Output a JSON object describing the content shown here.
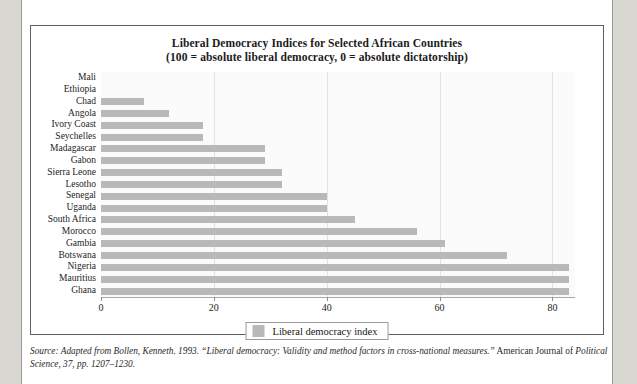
{
  "figure": {
    "title_line1": "Liberal Democracy Indices for Selected African Countries",
    "title_line2": "(100 = absolute liberal democracy, 0 = absolute dictatorship)"
  },
  "legend": {
    "label": "Liberal democracy index",
    "swatch_color": "#b9b9b9"
  },
  "source": {
    "italic_part": "Source: Adapted from Bollen, Kenneth. 1993. “Liberal democracy: Validity and method factors in cross-national measures.”",
    "roman_part": " American Journal of",
    "line2_italic": "Political Science, 37, pp. 1207–1230."
  },
  "chart_data": {
    "type": "bar",
    "orientation": "horizontal",
    "title": "Liberal Democracy Indices for Selected African Countries (100 = absolute liberal democracy, 0 = absolute dictatorship)",
    "xlabel": "",
    "ylabel": "",
    "xlim": [
      0,
      84
    ],
    "xticks": [
      0,
      20,
      40,
      60,
      80
    ],
    "xtick_labels": [
      "0",
      "20",
      "40",
      "60",
      "80"
    ],
    "grid": true,
    "legend_position": "bottom",
    "series_name": "Liberal democracy index",
    "bar_color": "#b9b9b9",
    "categories": [
      "Mali",
      "Ethiopia",
      "Chad",
      "Angola",
      "Ivory Coast",
      "Seychelles",
      "Madagascar",
      "Gabon",
      "Sierra Leone",
      "Lesotho",
      "Senegal",
      "Uganda",
      "South Africa",
      "Morocco",
      "Gambia",
      "Botswana",
      "Nigeria",
      "Mauritius",
      "Ghana"
    ],
    "values": [
      0,
      0,
      7.6,
      12,
      18,
      18,
      29,
      29,
      32,
      32,
      40,
      40,
      45,
      56,
      61,
      72,
      83,
      83,
      83
    ]
  }
}
